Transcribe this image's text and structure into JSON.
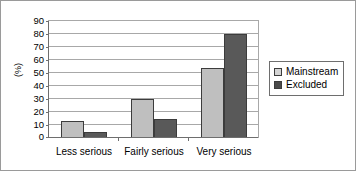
{
  "chart_data": {
    "type": "bar",
    "title": "",
    "xlabel": "",
    "ylabel": "(%)",
    "categories": [
      "Less serious",
      "Fairly serious",
      "Very serious"
    ],
    "series": [
      {
        "name": "Mainstream",
        "color": "#bfbfbf",
        "values": [
          12,
          29,
          53
        ]
      },
      {
        "name": "Excluded",
        "color": "#595959",
        "values": [
          4,
          14,
          79
        ]
      }
    ],
    "ylim": [
      0,
      90
    ],
    "ytick_step": 10,
    "yticks": [
      0,
      10,
      20,
      30,
      40,
      50,
      60,
      70,
      80,
      90
    ],
    "ytick_labels": [
      "0",
      "10",
      "20",
      "30",
      "40",
      "50",
      "60",
      "70",
      "80",
      "90"
    ],
    "grid": true,
    "grid_axis": "y",
    "legend_position": "right"
  },
  "legend": {
    "items": [
      {
        "label": "Mainstream",
        "swatch": "legend-swatch-mainstream"
      },
      {
        "label": "Excluded",
        "swatch": "legend-swatch-excluded"
      }
    ]
  }
}
